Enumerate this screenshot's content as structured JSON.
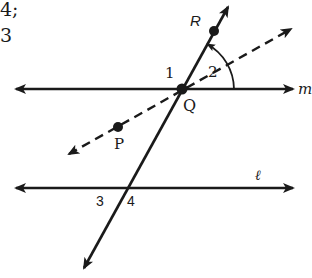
{
  "fragment_text": {
    "line1": "4;",
    "line2": "3"
  },
  "diagram": {
    "lines": {
      "m": {
        "label": "m",
        "type": "line",
        "style": "solid"
      },
      "l": {
        "label": "ℓ",
        "type": "line",
        "style": "solid"
      },
      "transversal": {
        "label": "",
        "type": "line",
        "style": "solid",
        "through": [
          "R",
          "Q"
        ]
      },
      "ray_QP": {
        "label": "",
        "type": "line",
        "style": "dashed",
        "through": [
          "P",
          "Q"
        ]
      }
    },
    "points": {
      "R": "R",
      "Q": "Q",
      "P": "P"
    },
    "angles": {
      "a1": "1",
      "a2": "2",
      "a3": "3",
      "a4": "4"
    },
    "colors": {
      "ink": "#1a1a1a",
      "background": "#ffffff"
    }
  }
}
